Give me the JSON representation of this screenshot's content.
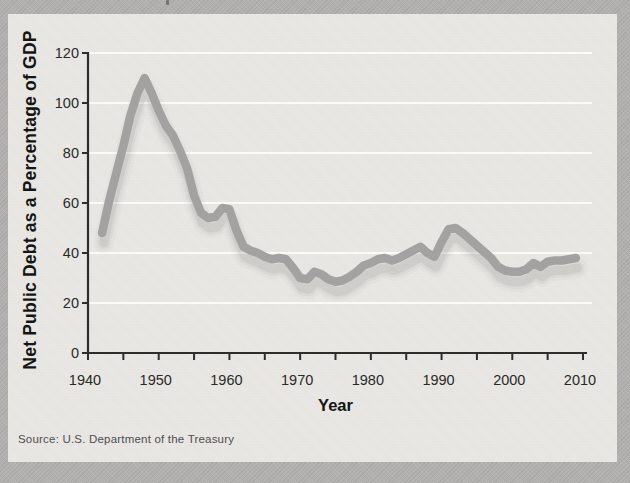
{
  "colors": {
    "page_bg": "#b2b1af",
    "card_bg": "#e8e7e4",
    "line": "#a3a2a0",
    "line_shadow": "#8d8d8b",
    "gridline": "#fafaf7",
    "axis": "#2e2d2b",
    "tick_label": "#2a2a28",
    "axis_title": "#151513",
    "source_text": "#4f4e4c"
  },
  "chart_data": {
    "type": "line",
    "title": "",
    "xlabel": "Year",
    "ylabel": "Net Public Debt as a Percentage of GDP",
    "xlim": [
      1940,
      2010
    ],
    "ylim": [
      0,
      120
    ],
    "x_tick_labels": [
      1940,
      1950,
      1960,
      1970,
      1980,
      1990,
      2000,
      2010
    ],
    "x_minor_tick_step": 5,
    "y_tick_labels": [
      0,
      20,
      40,
      60,
      80,
      100,
      120
    ],
    "grid": "horizontal-white",
    "legend_position": "none",
    "series": [
      {
        "name": "Net public debt as a percentage of GDP",
        "x": [
          1942,
          1943,
          1944,
          1945,
          1946,
          1947,
          1948,
          1949,
          1950,
          1951,
          1952,
          1953,
          1954,
          1955,
          1956,
          1957,
          1958,
          1959,
          1960,
          1961,
          1962,
          1963,
          1964,
          1965,
          1966,
          1967,
          1968,
          1969,
          1970,
          1971,
          1972,
          1973,
          1974,
          1975,
          1976,
          1977,
          1978,
          1979,
          1980,
          1981,
          1982,
          1983,
          1984,
          1985,
          1986,
          1987,
          1988,
          1989,
          1990,
          1991,
          1992,
          1993,
          1994,
          1995,
          1996,
          1997,
          1998,
          1999,
          2000,
          2001,
          2002,
          2003,
          2004,
          2005,
          2006,
          2007,
          2008,
          2009
        ],
        "values": [
          48,
          61,
          72,
          83,
          95,
          104,
          110,
          104,
          97,
          91,
          87,
          81,
          74,
          63,
          56,
          54,
          54.5,
          58,
          57.5,
          49,
          42.5,
          41,
          40,
          38.5,
          37.5,
          38,
          37.5,
          34,
          30,
          29.5,
          32.5,
          31.5,
          29.5,
          28.5,
          29,
          30.5,
          32.5,
          35,
          36,
          37.5,
          38,
          37,
          38,
          39.5,
          41,
          42.5,
          40,
          38.5,
          44.5,
          49.5,
          50,
          48,
          45.5,
          43,
          40.5,
          38,
          34.5,
          33,
          32.5,
          32.5,
          33.5,
          36,
          34.5,
          36.5,
          37,
          37,
          37.5,
          38
        ]
      }
    ]
  },
  "footer": {
    "source_label": "Source: U.S. Department of the Treasury"
  }
}
